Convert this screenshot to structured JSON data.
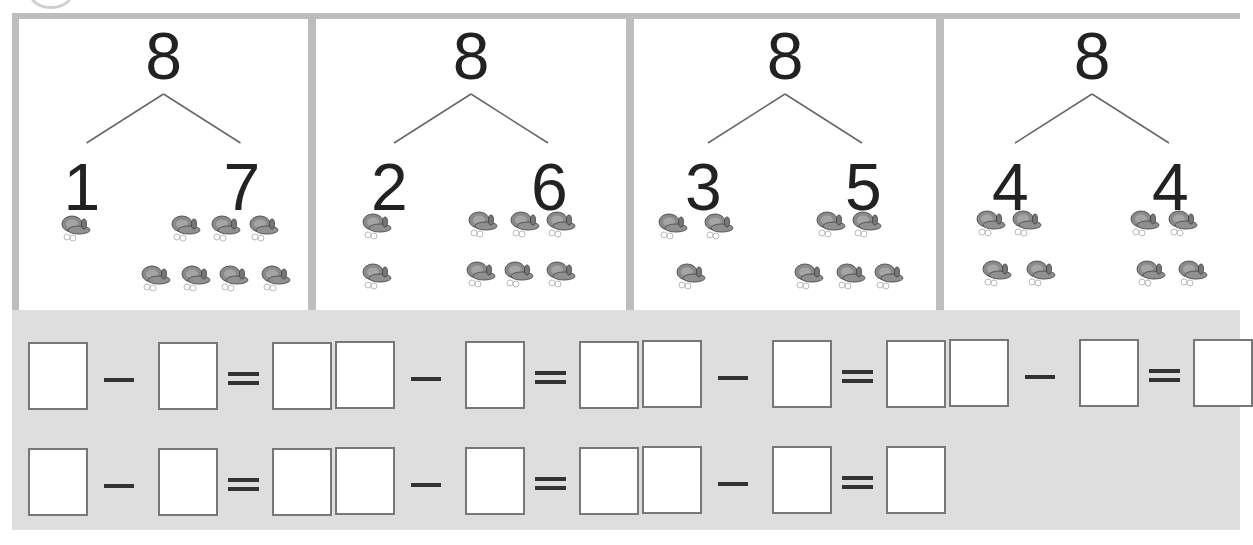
{
  "worksheet": {
    "topic": "number bonds of 8 and subtraction",
    "whole": "8",
    "panels": [
      {
        "whole": "8",
        "left": "1",
        "right": "7",
        "left_count": 1,
        "right_count": 7
      },
      {
        "whole": "8",
        "left": "2",
        "right": "6",
        "left_count": 2,
        "right_count": 6
      },
      {
        "whole": "8",
        "left": "3",
        "right": "5",
        "left_count": 3,
        "right_count": 5
      },
      {
        "whole": "8",
        "left": "4",
        "right": "4",
        "left_count": 4,
        "right_count": 4
      }
    ],
    "icon": "butterfly-icon",
    "equations": {
      "row1_count": 4,
      "row2_count": 3,
      "operator": "-",
      "equals": "="
    },
    "colors": {
      "panel_border": "#bdbdbd",
      "equation_bg": "#dedede",
      "box_border": "#777777",
      "text": "#222222"
    }
  }
}
